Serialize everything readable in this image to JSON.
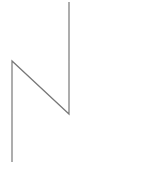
{
  "diagram": {
    "stroke_color": "#777777",
    "polyline_points": "12,162 12,61 69,114 69,2",
    "caption": ""
  }
}
